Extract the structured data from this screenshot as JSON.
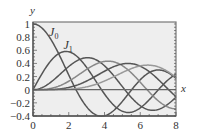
{
  "chart_data": {
    "type": "line",
    "title": "",
    "xlabel": "x",
    "ylabel": "y",
    "xlim": [
      0,
      8
    ],
    "ylim": [
      -0.4,
      1.03
    ],
    "grid": false,
    "legend": "none",
    "x_ticks": [
      "0",
      "2",
      "4",
      "6",
      "8"
    ],
    "y_ticks": [
      "-0.4",
      "-0.2",
      "0",
      "0.2",
      "0.4",
      "0.6",
      "0.8",
      "1"
    ],
    "annotations": [
      {
        "text": "J",
        "sub": "0",
        "x": 0.9,
        "y": 0.82
      },
      {
        "text": "J",
        "sub": "1",
        "x": 1.7,
        "y": 0.62
      }
    ],
    "x": [
      0,
      0.5,
      1,
      1.5,
      2,
      2.5,
      3,
      3.5,
      4,
      4.5,
      5,
      5.5,
      6,
      6.5,
      7,
      7.5,
      8
    ],
    "series": [
      {
        "name": "J0",
        "color": "#555555",
        "values": [
          1.0,
          0.94,
          0.77,
          0.51,
          0.22,
          -0.05,
          -0.26,
          -0.38,
          -0.4,
          -0.32,
          -0.18,
          -0.01,
          0.15,
          0.26,
          0.3,
          0.27,
          0.17
        ]
      },
      {
        "name": "J1",
        "color": "#555555",
        "values": [
          0.0,
          0.24,
          0.44,
          0.56,
          0.58,
          0.5,
          0.34,
          0.14,
          -0.07,
          -0.23,
          -0.33,
          -0.34,
          -0.28,
          -0.15,
          0.0,
          0.14,
          0.23
        ]
      },
      {
        "name": "J2",
        "color": "#555555",
        "values": [
          0.0,
          0.03,
          0.11,
          0.23,
          0.35,
          0.45,
          0.49,
          0.46,
          0.36,
          0.22,
          0.05,
          -0.12,
          -0.24,
          -0.31,
          -0.3,
          -0.23,
          -0.11
        ]
      },
      {
        "name": "J3",
        "color": "#888888",
        "values": [
          0.0,
          0.0,
          0.02,
          0.06,
          0.13,
          0.22,
          0.31,
          0.39,
          0.43,
          0.42,
          0.36,
          0.26,
          0.11,
          -0.04,
          -0.17,
          -0.26,
          -0.29
        ]
      },
      {
        "name": "J4",
        "color": "#555555",
        "values": [
          0.0,
          0.0,
          0.0,
          0.01,
          0.03,
          0.07,
          0.13,
          0.2,
          0.28,
          0.35,
          0.39,
          0.4,
          0.36,
          0.28,
          0.16,
          0.02,
          -0.11
        ]
      },
      {
        "name": "J5",
        "color": "#999999",
        "values": [
          0.0,
          0.0,
          0.0,
          0.0,
          0.01,
          0.02,
          0.04,
          0.08,
          0.13,
          0.19,
          0.26,
          0.32,
          0.36,
          0.37,
          0.35,
          0.28,
          0.19
        ]
      }
    ]
  },
  "style": {
    "plot_bg": "#eeeeee",
    "frame_color": "#777777",
    "axis_color": "#555555",
    "zero_line_color": "#666666"
  }
}
